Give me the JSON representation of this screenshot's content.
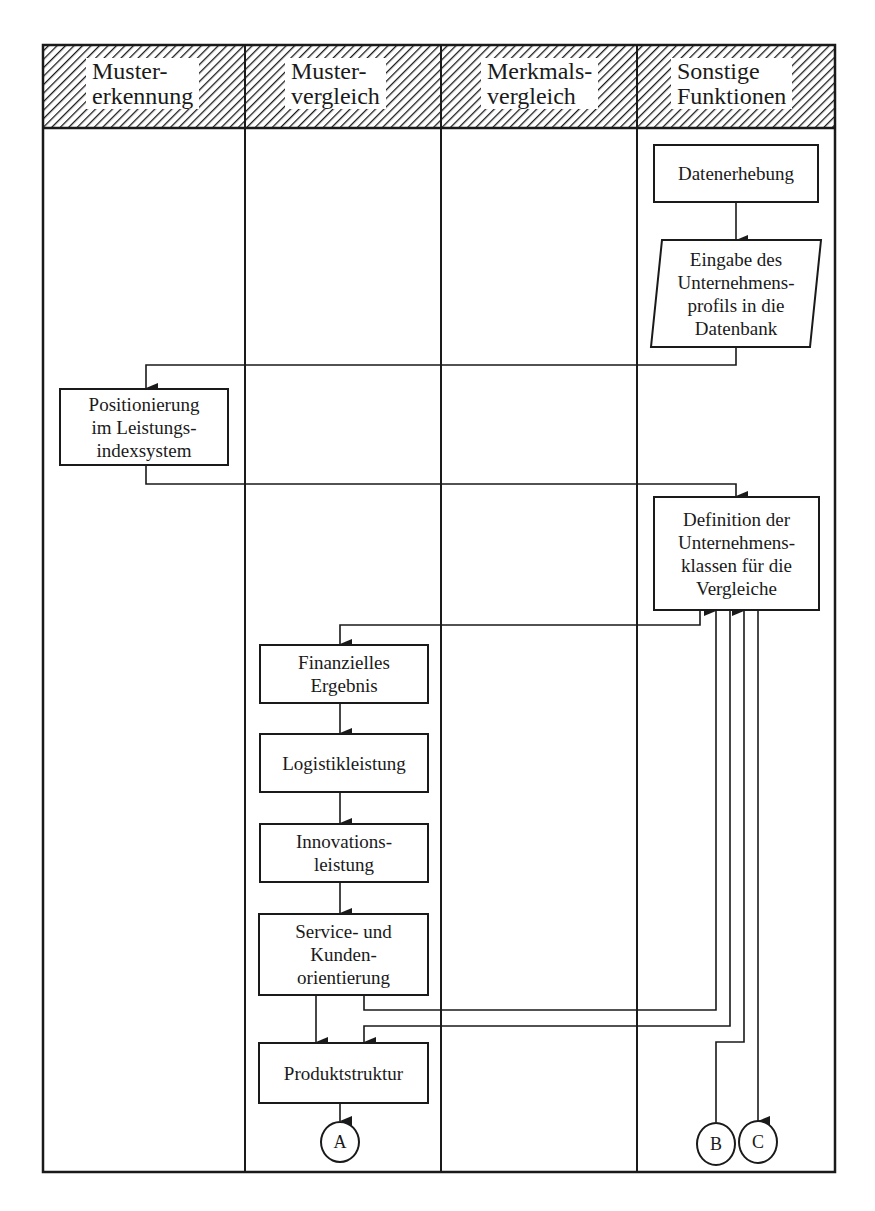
{
  "lanes": [
    {
      "id": "mustererkennung",
      "label": "Muster-\nerkennung"
    },
    {
      "id": "mustervergleich",
      "label": "Muster-\nvergleich"
    },
    {
      "id": "merkmalsvergleich",
      "label": "Merkmals-\nvergleich"
    },
    {
      "id": "sonstige",
      "label": "Sonstige\nFunktionen"
    }
  ],
  "nodes": {
    "datenerhebung": {
      "label": "Datenerhebung",
      "lane": "sonstige",
      "shape": "rectangle"
    },
    "eingabe": {
      "label": "Eingabe des\nUnternehmens-\nprofils in die\nDatenbank",
      "lane": "sonstige",
      "shape": "parallelogram"
    },
    "positionierung": {
      "label": "Positionierung\nim Leistungs-\nindexsystem",
      "lane": "mustererkennung",
      "shape": "rectangle"
    },
    "definition": {
      "label": "Definition der\nUnternehmens-\nklassen für die\nVergleiche",
      "lane": "sonstige",
      "shape": "rectangle"
    },
    "finanzielles": {
      "label": "Finanzielles\nErgebnis",
      "lane": "mustervergleich",
      "shape": "rectangle"
    },
    "logistik": {
      "label": "Logistikleistung",
      "lane": "mustervergleich",
      "shape": "rectangle"
    },
    "innovation": {
      "label": "Innovations-\nleistung",
      "lane": "mustervergleich",
      "shape": "rectangle"
    },
    "service": {
      "label": "Service- und\nKunden-\norientierung",
      "lane": "mustervergleich",
      "shape": "rectangle"
    },
    "produkt": {
      "label": "Produktstruktur",
      "lane": "mustervergleich",
      "shape": "rectangle"
    }
  },
  "connectors": {
    "a": {
      "label": "A",
      "lane": "mustervergleich"
    },
    "b": {
      "label": "B",
      "lane": "sonstige"
    },
    "c": {
      "label": "C",
      "lane": "sonstige"
    }
  },
  "edges": [
    {
      "from": "datenerhebung",
      "to": "eingabe"
    },
    {
      "from": "eingabe",
      "to": "positionierung"
    },
    {
      "from": "positionierung",
      "to": "definition"
    },
    {
      "from": "definition",
      "to": "finanzielles"
    },
    {
      "from": "finanzielles",
      "to": "logistik"
    },
    {
      "from": "logistik",
      "to": "innovation"
    },
    {
      "from": "innovation",
      "to": "service"
    },
    {
      "from": "service",
      "to": "produkt"
    },
    {
      "from": "service",
      "to": "definition"
    },
    {
      "from": "definition",
      "to": "produkt"
    },
    {
      "from": "b",
      "to": "definition"
    },
    {
      "from": "definition",
      "to": "c"
    },
    {
      "from": "produkt",
      "to": "a"
    }
  ]
}
